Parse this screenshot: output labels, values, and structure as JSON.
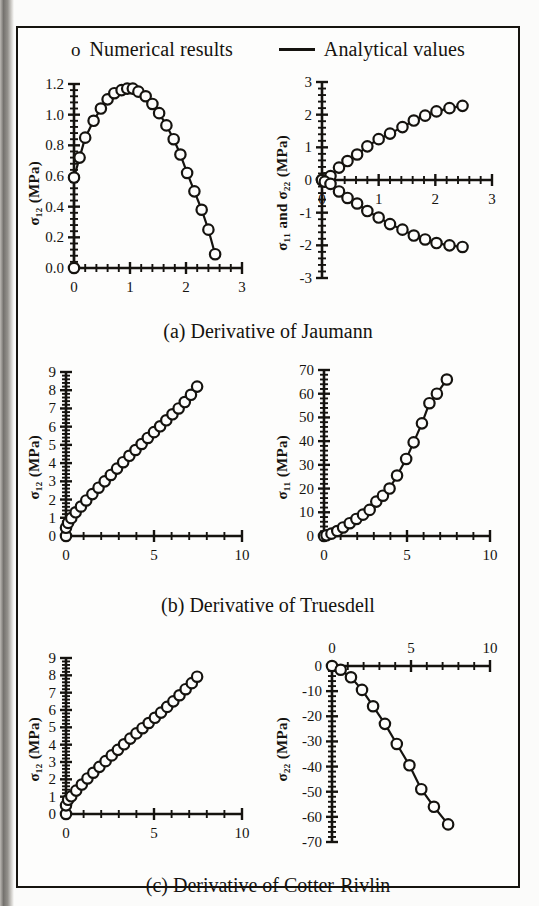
{
  "legend": {
    "numerical": {
      "marker": "o",
      "label": "Numerical results"
    },
    "analytical": {
      "marker": "line",
      "label": "Analytical values"
    }
  },
  "captions": {
    "a": "(a) Derivative of Jaumann",
    "b": "(b) Derivative of Truesdell",
    "c": "(c) Derivative of Cotter-Rivlin"
  },
  "axis_titles": {
    "sigma12": "σ₁₂ (MPa)",
    "sigma11_and_22": "σ₁₁ and σ₂₂ (MPa)",
    "sigma11": "σ₁₁ (MPa)",
    "sigma22": "σ₂₂ (MPa)"
  },
  "colors": {
    "ink": "#15130f",
    "paper": "#fdfdfc",
    "edge": "#6e6b67"
  },
  "chart_data": [
    {
      "id": "a-left",
      "type": "line",
      "title": "",
      "panel": "(a) Derivative of Jaumann - left",
      "xlabel": "",
      "ylabel": "σ₁₂ (MPa)",
      "xlim": [
        0,
        3
      ],
      "ylim": [
        0,
        1.2
      ],
      "xticks": [
        0,
        1,
        2,
        3
      ],
      "xticklabels": [
        "0",
        "1",
        "2",
        "3"
      ],
      "yticks": [
        0.0,
        0.2,
        0.4,
        0.6,
        0.8,
        1.0,
        1.2
      ],
      "yticklabels": [
        "0.0",
        "0.2",
        "0.4",
        "0.6",
        "0.8",
        "1.0",
        "1.2"
      ],
      "minor_ticks": true,
      "grid": false,
      "legend": "none",
      "series": [
        {
          "name": "Numerical results",
          "marker": "open-circle",
          "x": [
            0.0,
            0.0,
            0.1,
            0.2,
            0.35,
            0.48,
            0.6,
            0.72,
            0.85,
            0.95,
            1.05,
            1.15,
            1.28,
            1.4,
            1.52,
            1.65,
            1.78,
            1.9,
            2.02,
            2.15,
            2.28,
            2.4,
            2.52
          ],
          "y": [
            0.0,
            0.59,
            0.72,
            0.85,
            0.96,
            1.04,
            1.1,
            1.14,
            1.16,
            1.17,
            1.17,
            1.15,
            1.12,
            1.07,
            1.01,
            0.93,
            0.84,
            0.74,
            0.62,
            0.5,
            0.38,
            0.25,
            0.09
          ]
        }
      ]
    },
    {
      "id": "a-right",
      "type": "line",
      "panel": "(a) Derivative of Jaumann - right",
      "xlabel": "",
      "ylabel": "σ₁₁ and σ₂₂ (MPa)",
      "xlim": [
        0,
        3
      ],
      "ylim": [
        -3,
        3
      ],
      "xticks": [
        0,
        1,
        2,
        3
      ],
      "xticklabels": [
        "0",
        "1",
        "2",
        "3"
      ],
      "yticks": [
        -3,
        -2,
        -1,
        0,
        1,
        2,
        3
      ],
      "yticklabels": [
        "-3",
        "-2",
        "-1",
        "0",
        "1",
        "2",
        "3"
      ],
      "minor_ticks": true,
      "grid": false,
      "axis_position": "zero-crossing",
      "series": [
        {
          "name": "σ₁₁",
          "marker": "open-circle",
          "x": [
            0.0,
            0.05,
            0.15,
            0.3,
            0.45,
            0.62,
            0.8,
            1.0,
            1.2,
            1.42,
            1.62,
            1.82,
            2.02,
            2.25,
            2.48
          ],
          "y": [
            0.0,
            0.05,
            0.12,
            0.38,
            0.58,
            0.78,
            1.03,
            1.25,
            1.42,
            1.62,
            1.82,
            1.97,
            2.1,
            2.2,
            2.27
          ]
        },
        {
          "name": "σ₂₂",
          "marker": "open-circle",
          "x": [
            0.0,
            0.05,
            0.15,
            0.3,
            0.45,
            0.62,
            0.8,
            1.0,
            1.2,
            1.42,
            1.62,
            1.82,
            2.02,
            2.25,
            2.48
          ],
          "y": [
            0.0,
            -0.05,
            -0.12,
            -0.35,
            -0.55,
            -0.72,
            -0.95,
            -1.15,
            -1.35,
            -1.52,
            -1.7,
            -1.82,
            -1.93,
            -2.0,
            -2.05
          ]
        }
      ]
    },
    {
      "id": "b-left",
      "type": "line",
      "panel": "(b) Derivative of Truesdell - left",
      "xlabel": "",
      "ylabel": "σ₁₂ (MPa)",
      "xlim": [
        0,
        10
      ],
      "ylim": [
        0,
        9
      ],
      "xticks": [
        0,
        5,
        10
      ],
      "xticklabels": [
        "0",
        "5",
        "10"
      ],
      "yticks": [
        0,
        1,
        2,
        3,
        4,
        5,
        6,
        7,
        8,
        9
      ],
      "yticklabels": [
        "0",
        "1",
        "2",
        "3",
        "4",
        "5",
        "6",
        "7",
        "8",
        "9"
      ],
      "minor_ticks": true,
      "grid": false,
      "series": [
        {
          "name": "Numerical results",
          "marker": "open-circle",
          "x": [
            0.0,
            0.0,
            0.12,
            0.3,
            0.55,
            0.85,
            1.15,
            1.5,
            1.85,
            2.2,
            2.55,
            2.9,
            3.25,
            3.6,
            3.95,
            4.3,
            4.65,
            5.0,
            5.35,
            5.7,
            6.05,
            6.4,
            6.75,
            7.1,
            7.45
          ],
          "y": [
            0.0,
            0.45,
            0.72,
            0.98,
            1.3,
            1.62,
            1.95,
            2.3,
            2.65,
            3.0,
            3.35,
            3.7,
            4.05,
            4.4,
            4.72,
            5.05,
            5.38,
            5.7,
            6.02,
            6.35,
            6.68,
            7.0,
            7.35,
            7.75,
            8.2
          ]
        }
      ]
    },
    {
      "id": "b-right",
      "type": "line",
      "panel": "(b) Derivative of Truesdell - right",
      "xlabel": "",
      "ylabel": "σ₁₁ (MPa)",
      "xlim": [
        0,
        10
      ],
      "ylim": [
        0,
        70
      ],
      "xticks": [
        0,
        5,
        10
      ],
      "xticklabels": [
        "0",
        "5",
        "10"
      ],
      "yticks": [
        0,
        10,
        20,
        30,
        40,
        50,
        60,
        70
      ],
      "yticklabels": [
        "0",
        "10",
        "20",
        "30",
        "40",
        "50",
        "60",
        "70"
      ],
      "minor_ticks": true,
      "grid": false,
      "series": [
        {
          "name": "Numerical results",
          "marker": "open-circle",
          "x": [
            0.0,
            0.15,
            0.45,
            0.8,
            1.15,
            1.55,
            1.95,
            2.35,
            2.75,
            3.15,
            3.55,
            3.95,
            4.4,
            4.95,
            5.4,
            5.9,
            6.35,
            6.8,
            7.4
          ],
          "y": [
            0.0,
            0.3,
            1.0,
            2.1,
            3.6,
            5.4,
            7.2,
            9.0,
            11.0,
            14.5,
            17.0,
            20.0,
            25.5,
            32.5,
            39.5,
            47.5,
            56.0,
            60.0,
            66.0
          ]
        }
      ]
    },
    {
      "id": "c-left",
      "type": "line",
      "panel": "(c) Derivative of Cotter-Rivlin - left",
      "xlabel": "",
      "ylabel": "σ₁₂ (MPa)",
      "xlim": [
        0,
        10
      ],
      "ylim": [
        0,
        9
      ],
      "xticks": [
        0,
        5,
        10
      ],
      "xticklabels": [
        "0",
        "5",
        "10"
      ],
      "yticks": [
        0,
        1,
        2,
        3,
        4,
        5,
        6,
        7,
        8,
        9
      ],
      "yticklabels": [
        "0",
        "1",
        "2",
        "3",
        "4",
        "5",
        "6",
        "7",
        "8",
        "9"
      ],
      "minor_ticks": true,
      "grid": false,
      "series": [
        {
          "name": "Numerical results",
          "marker": "open-circle",
          "x": [
            0.0,
            0.0,
            0.12,
            0.3,
            0.58,
            0.9,
            1.22,
            1.55,
            1.9,
            2.25,
            2.6,
            2.95,
            3.3,
            3.65,
            4.0,
            4.35,
            4.7,
            5.05,
            5.4,
            5.75,
            6.1,
            6.45,
            6.8,
            7.15,
            7.45
          ],
          "y": [
            0.0,
            0.5,
            0.82,
            1.02,
            1.35,
            1.7,
            2.05,
            2.38,
            2.72,
            3.05,
            3.38,
            3.7,
            4.02,
            4.35,
            4.65,
            4.95,
            5.25,
            5.55,
            5.85,
            6.18,
            6.5,
            6.85,
            7.2,
            7.55,
            7.92
          ]
        }
      ]
    },
    {
      "id": "c-right",
      "type": "line",
      "panel": "(c) Derivative of Cotter-Rivlin - right",
      "xlabel": "",
      "ylabel": "σ₂₂ (MPa)",
      "xlim": [
        0,
        10
      ],
      "ylim": [
        -70,
        0
      ],
      "xticks": [
        0,
        5,
        10
      ],
      "xticklabels": [
        "0",
        "5",
        "10"
      ],
      "xaxis_position": "top",
      "yticks": [
        -70,
        -60,
        -50,
        -40,
        -30,
        -20,
        -10,
        0
      ],
      "yticklabels": [
        "-70",
        "-60",
        "-50",
        "-40",
        "-30",
        "-20",
        "-10",
        "0"
      ],
      "minor_ticks": true,
      "grid": false,
      "series": [
        {
          "name": "Numerical results",
          "marker": "open-circle",
          "x": [
            0.0,
            0.55,
            1.2,
            1.9,
            2.6,
            3.35,
            4.1,
            4.9,
            5.65,
            6.45,
            7.35
          ],
          "y": [
            0.0,
            -1.5,
            -4.5,
            -9.5,
            -16.0,
            -23.0,
            -31.0,
            -39.5,
            -49.0,
            -56.0,
            -63.0
          ]
        }
      ]
    }
  ]
}
